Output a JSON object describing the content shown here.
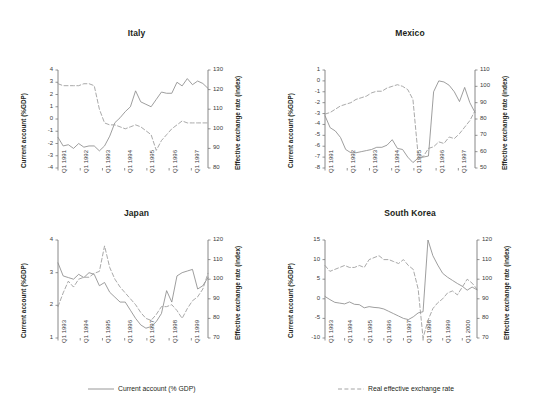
{
  "figure": {
    "background": "#ffffff",
    "line_color_solid": "#8c8c8c",
    "line_color_dashed": "#9a9a9a",
    "axis_color": "#7a7a7a"
  },
  "legend": [
    {
      "label": "Current account (% GDP)",
      "style": "solid",
      "name": "legend-current-account"
    },
    {
      "label": "Real effective exchange rate",
      "style": "dashed",
      "name": "legend-reer"
    }
  ],
  "chart_data": [
    {
      "type": "line",
      "title": "Italy",
      "xlabel": "",
      "ylabel": "Current account (%GDP)",
      "ylabel_right": "Effective exchange rate (index)",
      "ylim": [
        -4,
        4
      ],
      "yticks": [
        -4,
        -3,
        -2,
        -1,
        0,
        1,
        2,
        3,
        4
      ],
      "ylim_right": [
        80,
        130
      ],
      "yticks_right": [
        80,
        90,
        100,
        110,
        120,
        130
      ],
      "xticks": [
        "Q1 1991",
        "Q1 1992",
        "Q1 1993",
        "Q1 1994",
        "Q1 1995",
        "Q1 1996",
        "Q1 1997"
      ],
      "n_points": 28,
      "grid": false,
      "series": [
        {
          "name": "Current account (% GDP)",
          "axis": "left",
          "style": "solid",
          "values": [
            -1.5,
            -2.2,
            -2.1,
            -2.4,
            -2.0,
            -2.3,
            -2.2,
            -2.2,
            -2.6,
            -2.2,
            -1.4,
            -0.3,
            0.1,
            0.6,
            1.0,
            2.3,
            1.4,
            1.2,
            1.0,
            1.6,
            2.2,
            2.1,
            2.1,
            3.0,
            2.7,
            3.3,
            2.8,
            3.1,
            2.9,
            2.5
          ]
        },
        {
          "name": "Real effective exchange rate",
          "axis": "right",
          "style": "dashed",
          "values": [
            123,
            122,
            122,
            122,
            122,
            123,
            123,
            122,
            110,
            103,
            102,
            102,
            101,
            100,
            101,
            102,
            101,
            99,
            97,
            89,
            94,
            97,
            100,
            102,
            104,
            103,
            103,
            103,
            103,
            103
          ]
        }
      ]
    },
    {
      "type": "line",
      "title": "Mexico",
      "xlabel": "",
      "ylabel": "Current account (%GDP)",
      "ylabel_right": "Effective exchange rate (index)",
      "ylim": [
        -8,
        1
      ],
      "yticks": [
        1,
        0,
        -1,
        -2,
        -3,
        -4,
        -5,
        -6,
        -7,
        -8
      ],
      "ylim_right": [
        50,
        110
      ],
      "yticks_right": [
        50,
        60,
        70,
        80,
        90,
        100,
        110
      ],
      "xticks": [
        "Q1 1991",
        "Q1 1992",
        "Q1 1993",
        "Q1 1994",
        "Q1 1995",
        "Q1 1996",
        "Q1 1997"
      ],
      "n_points": 28,
      "grid": false,
      "series": [
        {
          "name": "Current account (% GDP)",
          "axis": "left",
          "style": "solid",
          "values": [
            -3.2,
            -4.3,
            -4.6,
            -5.2,
            -6.3,
            -6.6,
            -6.6,
            -6.5,
            -6.4,
            -6.3,
            -6.1,
            -6.1,
            -5.9,
            -5.4,
            -6.2,
            -6.3,
            -7.0,
            -7.5,
            -7.1,
            -7.0,
            -6.9,
            -1.0,
            0.0,
            -0.1,
            -0.4,
            -1.0,
            -1.9,
            -0.6,
            -2.0,
            -2.9
          ]
        },
        {
          "name": "Real effective exchange rate",
          "axis": "right",
          "style": "dashed",
          "values": [
            83,
            84,
            86,
            88,
            89,
            90,
            92,
            93,
            94,
            96,
            97,
            97,
            99,
            100,
            101,
            100,
            98,
            92,
            58,
            57,
            62,
            63,
            66,
            65,
            69,
            68,
            71,
            75,
            79,
            85
          ]
        }
      ]
    },
    {
      "type": "line",
      "title": "Japan",
      "xlabel": "",
      "ylabel": "Current account (%GDP)",
      "ylabel_right": "Effective exchange rate (index)",
      "ylim": [
        1,
        4
      ],
      "yticks": [
        1,
        2,
        3,
        4
      ],
      "ylim_right": [
        70,
        120
      ],
      "yticks_right": [
        70,
        80,
        90,
        100,
        110,
        120
      ],
      "xticks": [
        "Q1 1993",
        "Q1 1994",
        "Q1 1995",
        "Q1 1996",
        "Q1 1997",
        "Q1 1998",
        "Q1 1999"
      ],
      "n_points": 28,
      "grid": false,
      "series": [
        {
          "name": "Current account (% GDP)",
          "axis": "left",
          "style": "solid",
          "values": [
            3.3,
            2.9,
            2.85,
            2.8,
            2.95,
            2.85,
            3.0,
            2.95,
            2.6,
            2.7,
            2.4,
            2.25,
            2.1,
            2.1,
            1.85,
            1.6,
            1.4,
            1.3,
            1.35,
            1.5,
            1.75,
            2.45,
            2.1,
            2.9,
            3.0,
            3.05,
            3.1,
            2.5,
            2.6,
            2.85
          ]
        },
        {
          "name": "Real effective exchange rate",
          "axis": "right",
          "style": "dashed",
          "values": [
            86,
            93,
            99,
            96,
            100,
            101,
            101,
            103,
            104,
            117,
            106,
            100,
            96,
            93,
            90,
            87,
            83,
            80,
            79,
            82,
            86,
            86,
            87,
            84,
            80,
            85,
            89,
            91,
            95,
            103
          ]
        }
      ]
    },
    {
      "type": "line",
      "title": "South Korea",
      "xlabel": "",
      "ylabel": "Current account (%GDP)",
      "ylabel_right": "Effective exchange rate (index)",
      "ylim": [
        -10,
        15
      ],
      "yticks": [
        -10,
        -5,
        0,
        5,
        10,
        15
      ],
      "ylim_right": [
        70,
        120
      ],
      "yticks_right": [
        70,
        80,
        90,
        100,
        110,
        120
      ],
      "xticks": [
        "Q1 1993",
        "Q1 1994",
        "Q1 1995",
        "Q1 1996",
        "Q1 1997",
        "Q1 1998",
        "Q1 1999",
        "Q1 2000"
      ],
      "n_points": 32,
      "grid": false,
      "series": [
        {
          "name": "Current account (% GDP)",
          "axis": "left",
          "style": "solid",
          "values": [
            0.6,
            -0.2,
            -0.9,
            -1.1,
            -1.3,
            -0.8,
            -1.4,
            -1.5,
            -2.3,
            -2.0,
            -2.2,
            -2.3,
            -2.6,
            -3.2,
            -3.8,
            -4.4,
            -5.0,
            -5.3,
            -4.6,
            -3.6,
            -3.3,
            15.0,
            11.0,
            8.6,
            6.5,
            5.5,
            4.7,
            3.9,
            3.2,
            2.2,
            3.0,
            2.3
          ]
        },
        {
          "name": "Real effective exchange rate",
          "axis": "right",
          "style": "dashed",
          "values": [
            107,
            104,
            105,
            106,
            107,
            106,
            106,
            107,
            106,
            110,
            111,
            112,
            110,
            110,
            109,
            108,
            110,
            107,
            105,
            95,
            70,
            79,
            85,
            88,
            90,
            93,
            94,
            92,
            96,
            100,
            98,
            95
          ]
        }
      ]
    }
  ]
}
